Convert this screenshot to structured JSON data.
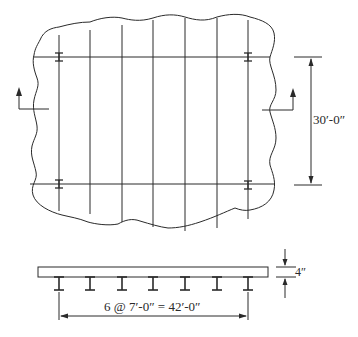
{
  "diagram": {
    "type": "structural-floor-framing-plan-and-section",
    "plan": {
      "girder_count": 7,
      "girder_x": [
        59,
        90,
        122,
        153,
        185,
        217,
        248
      ],
      "beam_lines_y": [
        57,
        184
      ],
      "section_cut_markers": [
        "left-section-arrow",
        "right-section-arrow"
      ]
    },
    "dimensions": {
      "span_between_beams": "30′-0″",
      "slab_thickness": "4″",
      "girder_spacing": "6 @ 7′-0″ = 42′-0″"
    },
    "colors": {
      "line": "#2a2a2a",
      "background": "#ffffff"
    }
  }
}
